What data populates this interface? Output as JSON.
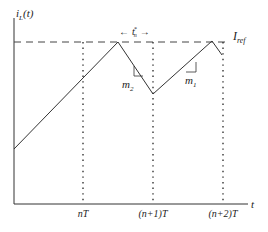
{
  "diagram": {
    "y_axis_label": "i",
    "y_axis_label_sub": "L",
    "y_axis_label_arg": "(t)",
    "x_axis_label": "t",
    "reference_label": "I",
    "reference_label_sub": "ref",
    "interval_label": "t",
    "interval_label_sub": "n",
    "interval_label_sup": "*",
    "interval_arrow_left": "←",
    "interval_arrow_right": "→",
    "slope_rising_label": "m",
    "slope_rising_sub": "1",
    "slope_falling_label": "m",
    "slope_falling_sub": "2",
    "ticks": [
      "nT",
      "(n+1)T",
      "(n+2)T"
    ],
    "colors": {
      "line": "#333333",
      "background": "#ffffff"
    }
  }
}
